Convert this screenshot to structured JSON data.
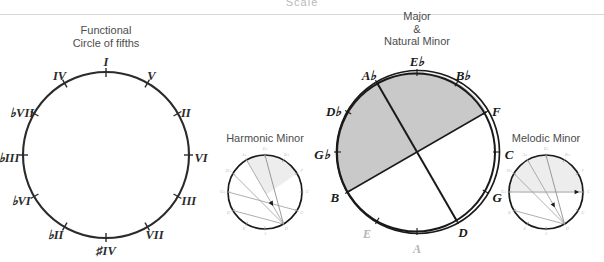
{
  "page": {
    "cut_off_top_text": "Scale",
    "background": "#ffffff"
  },
  "panels": {
    "functional": {
      "name": "functional-circle",
      "caption_line1": "Functional",
      "caption_line2": "Circle of fifths",
      "center": {
        "x": 106,
        "y": 155
      },
      "radius": 83,
      "labels": [
        {
          "text": "I",
          "angle": 0,
          "dx": 0,
          "dy": -9
        },
        {
          "text": "V",
          "angle": 30,
          "dx": 4,
          "dy": -6
        },
        {
          "text": "II",
          "angle": 60,
          "dx": 8,
          "dy": 1
        },
        {
          "text": "VI",
          "angle": 90,
          "dx": 12,
          "dy": 4
        },
        {
          "text": "III",
          "angle": 120,
          "dx": 11,
          "dy": 6
        },
        {
          "text": "VII",
          "angle": 150,
          "dx": 7,
          "dy": 9
        },
        {
          "text": "♯IV",
          "angle": 180,
          "dx": 0,
          "dy": 14
        },
        {
          "text": "♭II",
          "angle": 210,
          "dx": -9,
          "dy": 9
        },
        {
          "text": "♭VI",
          "angle": 240,
          "dx": -13,
          "dy": 6
        },
        {
          "text": "♭III",
          "angle": 270,
          "dx": -14,
          "dy": 4
        },
        {
          "text": "♭VII",
          "angle": 300,
          "dx": -12,
          "dy": 1
        },
        {
          "text": "IV",
          "angle": 330,
          "dx": -5,
          "dy": -6
        }
      ]
    },
    "major_minor": {
      "name": "major-natural-minor-circle",
      "caption_line1": "Major",
      "caption_line2": "&",
      "caption_line3": "Natural Minor",
      "center": {
        "x": 417,
        "y": 152
      },
      "radius": 80,
      "shaded_color": "#c9c9c9",
      "labels": [
        {
          "text": "E♭",
          "angle": 0,
          "bold": true,
          "dx": 0,
          "dy": -9
        },
        {
          "text": "B♭",
          "angle": 30,
          "bold": true,
          "dx": 6,
          "dy": -6
        },
        {
          "text": "F",
          "angle": 60,
          "bold": true,
          "dx": 10,
          "dy": 1
        },
        {
          "text": "C",
          "angle": 90,
          "bold": true,
          "dx": 12,
          "dy": 4
        },
        {
          "text": "G",
          "angle": 120,
          "bold": true,
          "dx": 11,
          "dy": 7
        },
        {
          "text": "D",
          "angle": 150,
          "bold": true,
          "dx": 6,
          "dy": 13
        },
        {
          "text": "A",
          "angle": 180,
          "bold": false,
          "dx": 0,
          "dy": 18
        },
        {
          "text": "E",
          "angle": 210,
          "bold": false,
          "dx": -10,
          "dy": 14
        },
        {
          "text": "B",
          "angle": 240,
          "bold": true,
          "dx": -13,
          "dy": 7
        },
        {
          "text": "G♭",
          "angle": 270,
          "bold": true,
          "dx": -15,
          "dy": 4
        },
        {
          "text": "D♭",
          "angle": 300,
          "bold": true,
          "dx": -14,
          "dy": 1
        },
        {
          "text": "A♭",
          "angle": 330,
          "bold": true,
          "dx": -8,
          "dy": -6
        }
      ]
    },
    "harmonic_minor": {
      "name": "harmonic-minor-circle",
      "caption": "Harmonic Minor",
      "center": {
        "x": 265,
        "y": 192
      },
      "radius": 37
    },
    "melodic_minor": {
      "name": "melodic-minor-circle",
      "caption": "Melodic Minor",
      "center": {
        "x": 546,
        "y": 192
      },
      "radius": 37
    }
  },
  "mini_circle_labels": [
    {
      "text": "E♭",
      "angle": 0
    },
    {
      "text": "B♭",
      "angle": 30
    },
    {
      "text": "F",
      "angle": 60
    },
    {
      "text": "C",
      "angle": 90
    },
    {
      "text": "G",
      "angle": 120
    },
    {
      "text": "D",
      "angle": 150
    },
    {
      "text": "A",
      "angle": 180
    },
    {
      "text": "E",
      "angle": 210
    },
    {
      "text": "B",
      "angle": 240
    },
    {
      "text": "G♭",
      "angle": 270
    },
    {
      "text": "D♭",
      "angle": 300
    },
    {
      "text": "A♭",
      "angle": 330
    }
  ],
  "colors": {
    "ink": "#1a1a1a",
    "caption": "#4d4d4d",
    "faint": "#b5b5b5",
    "shade": "#c9c9c9",
    "mini_shade": "#ececec",
    "divider": "#d8d8d8"
  }
}
